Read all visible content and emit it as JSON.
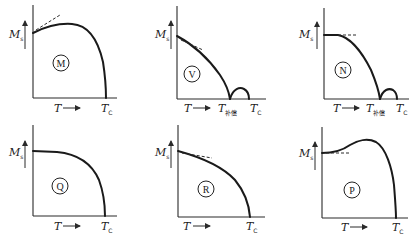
{
  "figure": {
    "axis_labels": {
      "y": "M",
      "y_sub": "s",
      "x": "T",
      "tc": "T",
      "tc_sub": "C",
      "tcomp": "T",
      "tcomp_sub": "补偿"
    },
    "panels": [
      {
        "id": "M",
        "label": "M",
        "shape": "rises then falls to Tc, dashed tangent upward at T=0"
      },
      {
        "id": "V",
        "label": "V",
        "shape": "falls to zero at T补偿, small hump up to Tc, dashed tangent at T=0"
      },
      {
        "id": "N",
        "label": "N",
        "shape": "flat then falls to zero at T补偿, small hump up to Tc, horizontal dashed line"
      },
      {
        "id": "Q",
        "label": "Q",
        "shape": "flat then falls steeply to Tc (Brillouin-like)"
      },
      {
        "id": "R",
        "label": "R",
        "shape": "decreases linearly-ish then drops to Tc, dashed tangent at T=0"
      },
      {
        "id": "P",
        "label": "P",
        "shape": "increases to maximum then falls to Tc, horizontal dashed line"
      }
    ]
  }
}
